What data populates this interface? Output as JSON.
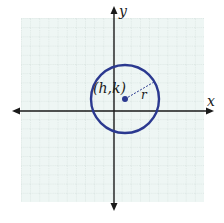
{
  "diagram": {
    "type": "circle-on-coordinate-plane",
    "axes": {
      "x_label": "x",
      "y_label": "y"
    },
    "center_label": "(h,k)",
    "radius_label": "r",
    "grid": {
      "cells_x": 20,
      "cells_y": 20,
      "visible": true
    },
    "colors": {
      "background": "#ffffff",
      "grid_fill": "#eef6f4",
      "grid_line": "#b9c7c3",
      "axis": "#1a1a1a",
      "circle": "#2b3990",
      "center_point": "#2b3990"
    }
  }
}
